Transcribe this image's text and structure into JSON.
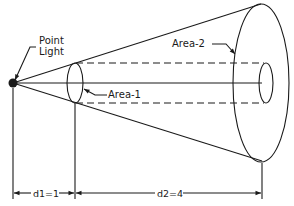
{
  "diagram": {
    "labels": {
      "point_light_line1": "Point",
      "point_light_line2": "Light",
      "area1": "Area-1",
      "area2": "Area-2",
      "d1": "d1=1",
      "d2": "d2=4"
    },
    "colors": {
      "stroke": "#1a1a1a",
      "background": "#ffffff"
    }
  }
}
